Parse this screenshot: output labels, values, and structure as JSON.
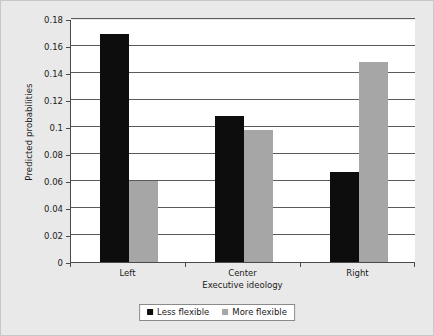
{
  "chart_data": {
    "type": "bar",
    "title": "",
    "xlabel": "Executive ideology",
    "ylabel": "Predicted probabilities",
    "categories": [
      "Left",
      "Center",
      "Right"
    ],
    "series": [
      {
        "name": "Less flexible",
        "color": "#0d0d0d",
        "values": [
          0.169,
          0.108,
          0.067
        ]
      },
      {
        "name": "More flexible",
        "color": "#a6a6a6",
        "values": [
          0.06,
          0.098,
          0.148
        ]
      }
    ],
    "ylim": [
      0,
      0.18
    ],
    "yticks": [
      0,
      0.02,
      0.04,
      0.06,
      0.08,
      0.1,
      0.12,
      0.14,
      0.16,
      0.18
    ],
    "ytick_labels": [
      "0",
      "0.02",
      "0.04",
      "0.06",
      "0.08",
      "0.1",
      "0.12",
      "0.14",
      "0.16",
      "0.18"
    ],
    "grid": "horizontal",
    "legend_position": "bottom-center"
  },
  "style": {
    "background": "#e9e9e9",
    "plot_background": "#ffffff",
    "axis_color": "#4a4a4a",
    "grid_color": "#5a5a5a",
    "text_color": "#1a1a1a"
  }
}
